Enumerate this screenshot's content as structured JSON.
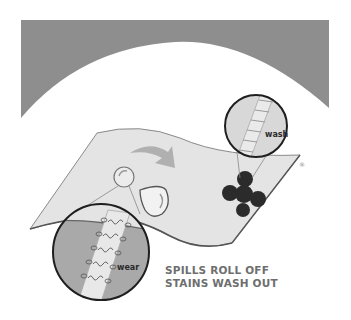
{
  "diagram": {
    "background_band_color": "#8e8e8e",
    "fabric_color": "#e4e4e4",
    "stain_color": "#2b2b2b",
    "arrow_color": "#b0b0b0",
    "elements": [
      {
        "type": "icon",
        "name": "liquid-droplet-icon",
        "description": "spill droplet beading on fabric"
      },
      {
        "type": "icon",
        "name": "direction-arrow-icon",
        "description": "arrow pointing from spill to stain"
      },
      {
        "type": "icon",
        "name": "stain-splat-icon",
        "description": "dark stain on fabric"
      },
      {
        "type": "icon",
        "name": "registered-mark-icon",
        "text": "®"
      }
    ],
    "magnifiers": {
      "wash": {
        "label": "wash"
      },
      "wear": {
        "label": "wear"
      }
    },
    "caption": {
      "line1": "SPILLS ROLL OFF",
      "line2": "STAINS WASH OUT"
    },
    "registered_mark": "®"
  }
}
